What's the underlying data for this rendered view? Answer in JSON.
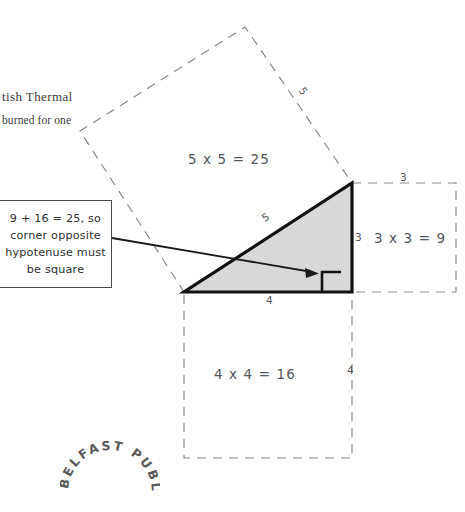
{
  "page": {
    "width": 465,
    "height": 512,
    "background": "#ffffff",
    "kind": "scanned-book-diagram"
  },
  "bleed_through_text": {
    "line1": "tish Thermal",
    "line2": "burned for one"
  },
  "callout": {
    "line1": "9 + 16 = 25, so",
    "line2": "corner opposite",
    "line3": "hypotenuse must",
    "line4": "be square",
    "border_color": "#4a4a4a",
    "arrow_color": "#1a1a1a"
  },
  "diagram": {
    "triangle": {
      "fill": "#d8d8d8",
      "stroke": "#111111",
      "legs": {
        "bottom": "4",
        "right": "3"
      },
      "hypotenuse": "5",
      "right_angle_marker": true
    },
    "squares": [
      {
        "name": "hypotenuse-square",
        "label": "5 x 5 = 25",
        "side_label": "5",
        "style": "dashed",
        "color": "#8a8a8a"
      },
      {
        "name": "vertical-leg-square",
        "label": "3 x 3 = 9",
        "side_label_top": "3",
        "side_label_left": "3",
        "style": "dashed",
        "color": "#8a8a8a"
      },
      {
        "name": "horizontal-leg-square",
        "label": "4 x 4 = 16",
        "side_label_top": "4",
        "side_label_right": "4",
        "style": "dashed",
        "color": "#8a8a8a"
      }
    ]
  },
  "stamp": {
    "text": "BELFAST PUBLIC LIBRARIES",
    "color": "#5a5a5a"
  }
}
